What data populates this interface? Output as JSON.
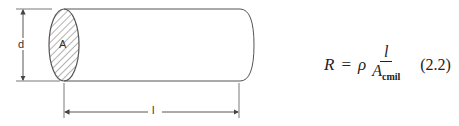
{
  "figure": {
    "area_label": "A",
    "diameter_label": "d",
    "length_label": "l",
    "stroke_color": "#555555"
  },
  "equation": {
    "lhs": "R",
    "equals": "=",
    "rho": "ρ",
    "numerator": "l",
    "denominator_base": "A",
    "denominator_sub": "cmil",
    "number": "(2.2)"
  }
}
